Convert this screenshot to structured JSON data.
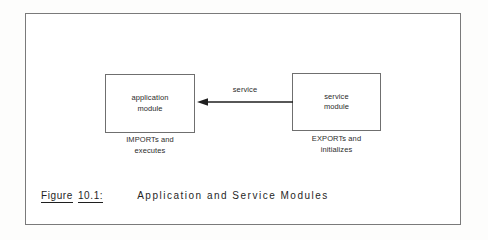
{
  "figure": {
    "caption_label": "Figure",
    "caption_number": "10.1:",
    "caption_title": "Application and Service Modules"
  },
  "diagram": {
    "type": "block-diagram",
    "nodes": [
      {
        "id": "application-module",
        "title": "application\nmodule",
        "subcaption": "IMPORTs and\nexecutes"
      },
      {
        "id": "service-module",
        "title": "service\nmodule",
        "subcaption": "EXPORTs and\ninitializes"
      }
    ],
    "edges": [
      {
        "id": "service-arrow",
        "label": "service",
        "from": "service-module",
        "to": "application-module",
        "direction": "right-to-left"
      }
    ]
  },
  "colors": {
    "ink": "#1f1f1f",
    "text": "#2b2b2b",
    "rule": "#6f6f6f",
    "frame": "#7a7a7a",
    "paper": "#ffffff"
  }
}
